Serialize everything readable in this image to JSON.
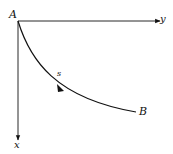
{
  "figure": {
    "labels": {
      "origin": "A",
      "end_point": "B",
      "horizontal_axis": "y",
      "vertical_axis": "x",
      "arc_length": "s"
    },
    "colors": {
      "stroke": "#111111",
      "background": "#ffffff"
    }
  }
}
